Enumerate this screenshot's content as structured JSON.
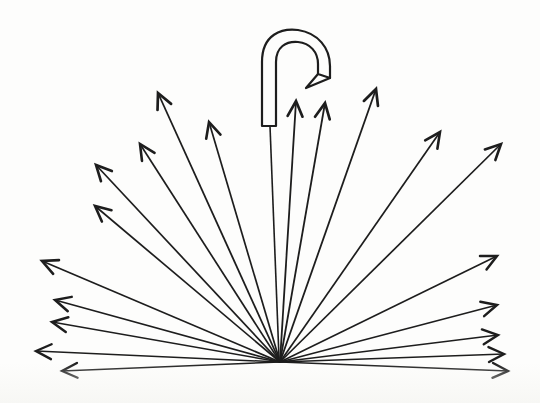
{
  "figure": {
    "title": "Radiating arrow fan with hooked cane",
    "type": "line-diagram",
    "canvas": {
      "width": 540,
      "height": 403
    },
    "background_color": "#fdfdfc",
    "ink_color": "#1d1d1d",
    "origin": {
      "x": 280,
      "y": 362,
      "label": "fan-convergence-point"
    },
    "arrow_count": 19,
    "arrow_head_length": 17,
    "arrow_head_half_angle_deg": 26,
    "hook": {
      "name": "cane-hook",
      "stroke_width": 2.2,
      "outline": "M 262 126 L 262 62 C 262 34 282 28 298 30 C 318 33 330 48 330 66 L 330 78 L 318 74 L 318 64 C 318 52 310 43 298 42 C 286 41 276 47 276 62 L 276 126 Z",
      "tip_notch": "M 330 78 L 306 88 L 318 74",
      "shaft": {
        "x1": 270,
        "y1": 126,
        "x2": 279,
        "y2": 358,
        "stroke_width": 1.6
      }
    },
    "baseline": {
      "name": "ground-line",
      "x1": 62,
      "y1": 377,
      "x2": 508,
      "y2": 377,
      "stroke_width": 1.2,
      "visible": false
    },
    "arrows": [
      {
        "id": "arrow-01",
        "label": "left-horizontal-lowest",
        "tip": {
          "x": 62,
          "y": 371
        },
        "angle_deg": 179,
        "stroke_width": 1.4,
        "has_head": true
      },
      {
        "id": "arrow-02",
        "label": "left-horizontal-low",
        "tip": {
          "x": 36,
          "y": 351
        },
        "angle_deg": 177,
        "stroke_width": 1.5,
        "has_head": true
      },
      {
        "id": "arrow-03",
        "label": "left-shallow-lower",
        "tip": {
          "x": 52,
          "y": 322
        },
        "angle_deg": 170,
        "stroke_width": 1.6,
        "has_head": true
      },
      {
        "id": "arrow-04",
        "label": "left-shallow-upper",
        "tip": {
          "x": 55,
          "y": 300
        },
        "angle_deg": 166,
        "stroke_width": 1.6,
        "has_head": true
      },
      {
        "id": "arrow-05",
        "label": "left-diagonal-low",
        "tip": {
          "x": 42,
          "y": 261
        },
        "angle_deg": 159,
        "stroke_width": 1.7,
        "has_head": true
      },
      {
        "id": "arrow-06",
        "label": "left-diagonal-mid",
        "tip": {
          "x": 95,
          "y": 206
        },
        "angle_deg": 143,
        "stroke_width": 1.7,
        "has_head": true
      },
      {
        "id": "arrow-07",
        "label": "left-diagonal-high",
        "tip": {
          "x": 96,
          "y": 165
        },
        "angle_deg": 137,
        "stroke_width": 1.7,
        "has_head": true
      },
      {
        "id": "arrow-08",
        "label": "left-steep-outer",
        "tip": {
          "x": 140,
          "y": 144
        },
        "angle_deg": 128,
        "stroke_width": 1.7,
        "has_head": true
      },
      {
        "id": "arrow-09",
        "label": "left-steep-inner",
        "tip": {
          "x": 158,
          "y": 93
        },
        "angle_deg": 114,
        "stroke_width": 1.8,
        "has_head": true
      },
      {
        "id": "arrow-10",
        "label": "left-near-vertical",
        "tip": {
          "x": 209,
          "y": 122
        },
        "angle_deg": 104,
        "stroke_width": 1.7,
        "has_head": true
      },
      {
        "id": "arrow-11",
        "label": "center-vertical-left",
        "tip": {
          "x": 296,
          "y": 101
        },
        "angle_deg": 86,
        "stroke_width": 1.8,
        "has_head": true
      },
      {
        "id": "arrow-12",
        "label": "center-vertical-right",
        "tip": {
          "x": 325,
          "y": 103
        },
        "angle_deg": 82,
        "stroke_width": 1.8,
        "has_head": true
      },
      {
        "id": "arrow-13",
        "label": "right-steep-inner",
        "tip": {
          "x": 376,
          "y": 89
        },
        "angle_deg": 73,
        "stroke_width": 1.8,
        "has_head": true
      },
      {
        "id": "arrow-14",
        "label": "right-steep-outer",
        "tip": {
          "x": 440,
          "y": 132
        },
        "angle_deg": 54,
        "stroke_width": 1.7,
        "has_head": true
      },
      {
        "id": "arrow-15",
        "label": "right-diagonal-high",
        "tip": {
          "x": 501,
          "y": 144
        },
        "angle_deg": 46,
        "stroke_width": 1.7,
        "has_head": true
      },
      {
        "id": "arrow-16",
        "label": "right-diagonal-mid",
        "tip": {
          "x": 497,
          "y": 256
        },
        "angle_deg": 27,
        "stroke_width": 1.6,
        "has_head": true
      },
      {
        "id": "arrow-17",
        "label": "right-shallow-upper",
        "tip": {
          "x": 497,
          "y": 305
        },
        "angle_deg": 16,
        "stroke_width": 1.6,
        "has_head": true
      },
      {
        "id": "arrow-18",
        "label": "right-shallow-lower",
        "tip": {
          "x": 498,
          "y": 335
        },
        "angle_deg": 7,
        "stroke_width": 1.5,
        "has_head": true
      },
      {
        "id": "arrow-19",
        "label": "right-horizontal-low",
        "tip": {
          "x": 504,
          "y": 354
        },
        "angle_deg": 2,
        "stroke_width": 1.5,
        "has_head": true
      },
      {
        "id": "arrow-20",
        "label": "right-horizontal-lowest",
        "tip": {
          "x": 508,
          "y": 371
        },
        "angle_deg": 1,
        "stroke_width": 1.4,
        "has_head": true
      }
    ]
  }
}
